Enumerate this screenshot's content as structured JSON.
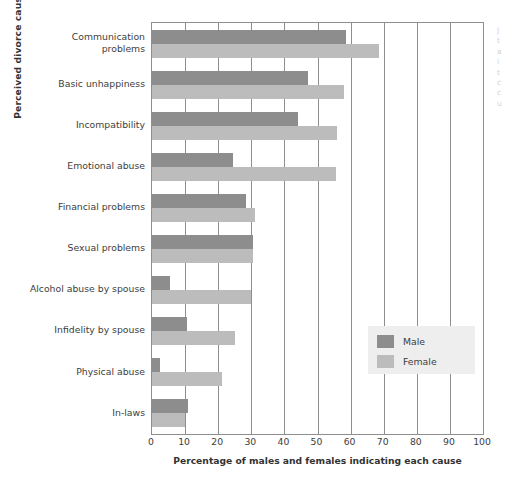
{
  "chart_data": {
    "type": "bar",
    "orientation": "horizontal",
    "title": "",
    "xlabel": "Percentage of males and females indicating each cause",
    "ylabel": "Perceived divorce causes",
    "xlim": [
      0,
      100
    ],
    "xticks": [
      0,
      10,
      20,
      30,
      40,
      50,
      60,
      70,
      80,
      90,
      100
    ],
    "grid": true,
    "grid_axis": "x",
    "legend": [
      "Male",
      "Female"
    ],
    "legend_position": "center-right",
    "categories": [
      "Communication\nproblems",
      "Basic unhappiness",
      "Incompatibility",
      "Emotional abuse",
      "Financial problems",
      "Sexual problems",
      "Alcohol abuse by spouse",
      "Infidelity by spouse",
      "Physical abuse",
      "In-laws"
    ],
    "series": [
      {
        "name": "Male",
        "color": "#8d8d8d",
        "values": [
          58.5,
          47,
          44,
          24.5,
          28.5,
          30.5,
          5.5,
          10.5,
          2.5,
          11
        ]
      },
      {
        "name": "Female",
        "color": "#bcbcbc",
        "values": [
          68.5,
          58,
          56,
          55.5,
          31,
          30.5,
          30,
          25,
          21,
          10
        ]
      }
    ]
  },
  "axis": {
    "x_title": "Percentage of males and females indicating each cause",
    "y_title": "Perceived divorce causes",
    "tick_labels": [
      "0",
      "10",
      "20",
      "30",
      "40",
      "50",
      "60",
      "70",
      "80",
      "90",
      "100"
    ]
  },
  "legend": {
    "male_label": "Male",
    "female_label": "Female"
  },
  "margin_note": {
    "text": "J\nt\na\ni\nt\nc\nc\nu"
  }
}
